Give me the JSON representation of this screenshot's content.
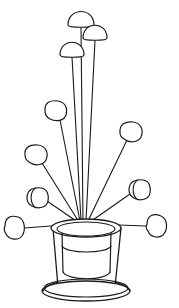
{
  "artwork": {
    "title": "Flowers in a Vase",
    "medium": "black ink line drawing",
    "background_color": "#ffffff",
    "line_color": "#1a1a1a",
    "canvas": {
      "width": 179,
      "height": 308
    }
  },
  "vessel": {
    "name": "vase",
    "description": "tapered cylindrical vase with elliptical mouth, inner rim line and flared round foot",
    "mouth": {
      "cx": 86,
      "cy": 228,
      "rx": 35,
      "ry": 9
    },
    "inner_mouth": {
      "cx": 86,
      "cy": 229,
      "rx": 29,
      "ry": 7
    },
    "body_top_left_x": 53,
    "body_top_right_x": 121,
    "body_bottom_left_x": 58,
    "body_bottom_right_x": 115,
    "body_bottom_y": 287,
    "inner_band": {
      "cx": 86,
      "cy": 246,
      "rx": 29,
      "ry": 8
    },
    "inner_wall_left_x": 62,
    "inner_wall_right_x": 112,
    "inner_wall_bottom_y": 277,
    "foot_outer": {
      "cx": 86,
      "cy": 291,
      "rx": 44,
      "ry": 10
    },
    "foot_inner": {
      "cx": 86,
      "cy": 288,
      "rx": 42,
      "ry": 9
    }
  },
  "convergence_point": {
    "x": 84,
    "y": 222
  },
  "flowers": [
    {
      "id": "flower-tall-center-left",
      "label": "tall dome bloom, upper left of the three tall stems",
      "head_shape": "dome",
      "head": {
        "cx": 81,
        "cy": 14,
        "rx": 13,
        "ry": 13
      },
      "stem_from": {
        "x": 81,
        "y": 27
      },
      "stem_to": {
        "x": 83,
        "y": 221
      }
    },
    {
      "id": "flower-tall-right",
      "label": "tall dome bloom, upper right of the three tall stems",
      "head_shape": "dome",
      "head": {
        "cx": 95,
        "cy": 28,
        "rx": 12,
        "ry": 12
      },
      "stem_from": {
        "x": 95,
        "y": 40
      },
      "stem_to": {
        "x": 86,
        "y": 221
      }
    },
    {
      "id": "flower-tall-left",
      "label": "tall dome bloom, lower of the three tall stems",
      "head_shape": "dome",
      "head": {
        "cx": 72,
        "cy": 45,
        "rx": 12,
        "ry": 12
      },
      "stem_from": {
        "x": 72,
        "y": 57
      },
      "stem_to": {
        "x": 81,
        "y": 221
      }
    },
    {
      "id": "flower-mid-upper-left",
      "label": "mid-height bloom angled up-left",
      "head_shape": "round",
      "head": {
        "cx": 56,
        "cy": 111,
        "rx": 11,
        "ry": 10
      },
      "stem_from": {
        "x": 60,
        "y": 120
      },
      "stem_to": {
        "x": 80,
        "y": 221
      }
    },
    {
      "id": "flower-mid-upper-right",
      "label": "mid-height bloom angled up-right",
      "head_shape": "round",
      "head": {
        "cx": 131,
        "cy": 132,
        "rx": 11,
        "ry": 10
      },
      "stem_from": {
        "x": 127,
        "y": 140
      },
      "stem_to": {
        "x": 88,
        "y": 221
      }
    },
    {
      "id": "flower-mid-left",
      "label": "bloom angled left above the side-view bloom",
      "head_shape": "round",
      "head": {
        "cx": 36,
        "cy": 155,
        "rx": 11,
        "ry": 10
      },
      "stem_from": {
        "x": 42,
        "y": 163
      },
      "stem_to": {
        "x": 79,
        "y": 222
      }
    },
    {
      "id": "flower-side-right",
      "label": "side-view bloom on the right with inner petal arc",
      "head_shape": "side-view",
      "head": {
        "cx": 139,
        "cy": 190,
        "rx": 11,
        "ry": 10
      },
      "inner_arc": true,
      "stem_from": {
        "x": 130,
        "y": 194
      },
      "stem_to": {
        "x": 90,
        "y": 222
      }
    },
    {
      "id": "flower-side-left",
      "label": "side-view bloom on the left with inner petal arc",
      "head_shape": "side-view",
      "head": {
        "cx": 37,
        "cy": 198,
        "rx": 11,
        "ry": 10
      },
      "inner_arc": true,
      "stem_from": {
        "x": 47,
        "y": 201
      },
      "stem_to": {
        "x": 79,
        "y": 223
      }
    },
    {
      "id": "flower-low-left",
      "label": "low near-horizontal bloom at far left",
      "head_shape": "oval",
      "head": {
        "cx": 14,
        "cy": 227,
        "rx": 10,
        "ry": 11
      },
      "stem_from": {
        "x": 24,
        "y": 228
      },
      "stem_to": {
        "x": 78,
        "y": 224
      }
    },
    {
      "id": "flower-low-right",
      "label": "low near-horizontal bloom at far right",
      "head_shape": "oval",
      "head": {
        "cx": 156,
        "cy": 225,
        "rx": 10,
        "ry": 11
      },
      "stem_from": {
        "x": 146,
        "y": 226
      },
      "stem_to": {
        "x": 92,
        "y": 224
      }
    }
  ],
  "counts": {
    "flower_count": 10,
    "stem_count": 10
  }
}
